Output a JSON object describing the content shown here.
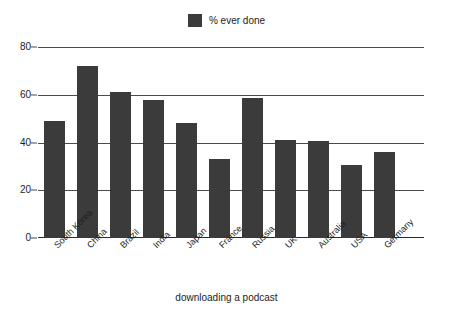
{
  "chart_data": {
    "type": "bar",
    "title": "",
    "subtitle": "",
    "xlabel": "downloading a podcast",
    "ylabel": "",
    "categories": [
      "South Korea",
      "China",
      "Brazil",
      "India",
      "Japan",
      "France",
      "Russia",
      "UK",
      "Australia",
      "USA",
      "Germany"
    ],
    "values": [
      49,
      72,
      61,
      58,
      48,
      33,
      58.5,
      41,
      40.5,
      30.5,
      36
    ],
    "series": [
      {
        "name": "% ever done",
        "values": [
          49,
          72,
          61,
          58,
          48,
          33,
          58.5,
          41,
          40.5,
          30.5,
          36
        ],
        "color": "#3b3b3b"
      }
    ],
    "ylim": [
      0,
      80
    ],
    "ytick_labels": [
      "0",
      "20",
      "40",
      "60",
      "80"
    ],
    "ytick_values": [
      0,
      20,
      40,
      60,
      80
    ],
    "grid": true,
    "legend_position": "top-center",
    "legend_entries": [
      {
        "label": "% ever done",
        "color": "#3b3b3b",
        "swatch": "square-swatch-icon"
      }
    ]
  },
  "legend": {
    "label": "% ever done"
  },
  "axis": {
    "x_title": "downloading a podcast"
  },
  "colors": {
    "bar": "#3b3b3b",
    "gridline": "#4a4a4a",
    "text": "#1d1d1d",
    "background": "#ffffff"
  }
}
